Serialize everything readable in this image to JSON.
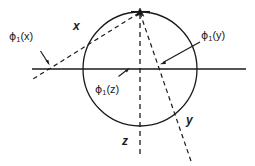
{
  "figure": {
    "background_color": "#ffffff",
    "stroke_color": "#1a1a1a",
    "labels": {
      "phi_x": {
        "symbol": "ϕ",
        "sub": "1",
        "arg": "(x)"
      },
      "phi_y": {
        "symbol": "ϕ",
        "sub": "1",
        "arg": "(y)"
      },
      "phi_z": {
        "symbol": "ϕ",
        "sub": "1",
        "arg": "(z)"
      },
      "axis_x": "x",
      "axis_y": "y",
      "axis_z": "z"
    },
    "geometry": {
      "circle": {
        "cx": 140,
        "cy": 69,
        "r": 57
      },
      "apex": {
        "x": 140,
        "y": 12
      },
      "horizontal_axis": {
        "x1": 32,
        "y1": 69,
        "x2": 246,
        "y2": 69
      },
      "z_axis_dashed": {
        "x1": 140,
        "y1": 12,
        "x2": 140,
        "y2": 156
      },
      "x_axis_dashed": {
        "x1": 140,
        "y1": 12,
        "x2": 33,
        "y2": 79
      },
      "y_axis_dashed": {
        "x1": 140,
        "y1": 12,
        "x2": 191,
        "y2": 161
      }
    }
  }
}
